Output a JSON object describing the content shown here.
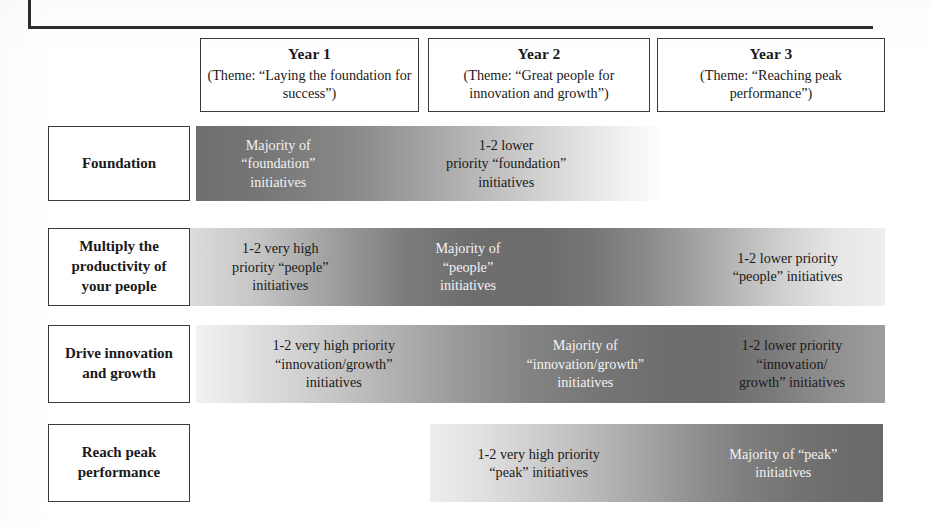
{
  "figure": {
    "type": "roadmap-matrix",
    "columns": [
      {
        "id": "year-1",
        "title": "Year 1",
        "theme": "(Theme: “Laying the\nfoundation for success”)"
      },
      {
        "id": "year-2",
        "title": "Year 2",
        "theme": "(Theme: “Great people for\ninnovation and growth”)"
      },
      {
        "id": "year-3",
        "title": "Year 3",
        "theme": "(Theme: “Reaching\npeak performance”)"
      }
    ],
    "rows": [
      {
        "id": "foundation",
        "label": "Foundation",
        "cells": [
          {
            "text": "Majority of\n“foundation”\ninitiatives",
            "tone": "dark",
            "left_pct": 0,
            "width_pct": 35
          },
          {
            "text": "1-2 lower\npriority “foundation”\ninitiatives",
            "tone": "light",
            "left_pct": 44,
            "width_pct": 44
          }
        ]
      },
      {
        "id": "multiply-productivity",
        "label": "Multiply the\nproductivity of\nyour people",
        "cells": [
          {
            "text": "1-2 very high\npriority “people”\ninitiatives",
            "tone": "light",
            "left_pct": 0,
            "width_pct": 26
          },
          {
            "text": "Majority of\n“people”\ninitiatives",
            "tone": "dark",
            "left_pct": 28,
            "width_pct": 24
          },
          {
            "text": "1-2 lower priority\n“people” initiatives",
            "tone": "light",
            "left_pct": 72,
            "width_pct": 28
          }
        ]
      },
      {
        "id": "drive-innovation",
        "label": "Drive\ninnovation and\ngrowth",
        "cells": [
          {
            "text": "1-2 very high priority\n“innovation/growth”\ninitiatives",
            "tone": "light",
            "left_pct": 4,
            "width_pct": 32
          },
          {
            "text": "Majority of\n“innovation/growth”\ninitiatives",
            "tone": "dark",
            "left_pct": 42,
            "width_pct": 29
          },
          {
            "text": "1-2 lower priority\n“innovation/\ngrowth” initiatives",
            "tone": "light",
            "left_pct": 73,
            "width_pct": 27
          }
        ]
      },
      {
        "id": "reach-peak-performance",
        "label": "Reach peak\nperformance",
        "cells": [
          {
            "text": "1-2 very high priority\n“peak” initiatives",
            "tone": "light",
            "left_pct": 2,
            "width_pct": 44
          },
          {
            "text": "Majority of “peak”\ninitiatives",
            "tone": "dark",
            "left_pct": 58,
            "width_pct": 40
          }
        ]
      }
    ],
    "colors": {
      "band_dark": "#6c6c6c",
      "band_light": "#ffffff",
      "border": "#3a3a3e",
      "text_dark": "#1a1a1a",
      "text_light": "#f2f2f2"
    }
  }
}
